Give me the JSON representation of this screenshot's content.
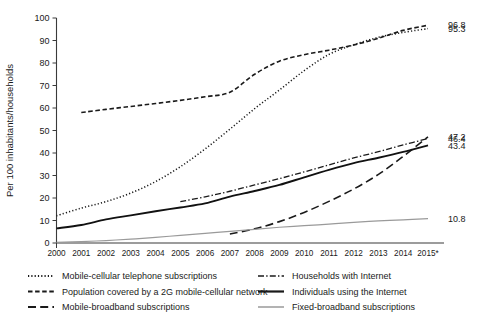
{
  "chart_data": {
    "type": "line",
    "title": "",
    "xlabel": "",
    "ylabel": "Per 100 inhabitants/households",
    "ylim": [
      0,
      100
    ],
    "ytick_step": 10,
    "yticks": [
      "0",
      "10",
      "20",
      "30",
      "40",
      "50",
      "60",
      "70",
      "80",
      "90",
      "100"
    ],
    "grid": false,
    "legend_position": "bottom",
    "x": [
      "2000",
      "2001",
      "2002",
      "2003",
      "2004",
      "2005",
      "2006",
      "2007",
      "2008",
      "2009",
      "2010",
      "2011",
      "2012",
      "2013",
      "2014",
      "2015*"
    ],
    "categories": [
      "2000",
      "2001",
      "2002",
      "2003",
      "2004",
      "2005",
      "2006",
      "2007",
      "2008",
      "2009",
      "2010",
      "2011",
      "2012",
      "2013",
      "2014",
      "2015*"
    ],
    "footnote_marker": "*",
    "series": [
      {
        "name": "Mobile-cellular telephone subscriptions",
        "style": "dotted",
        "color": "#1a1a1a",
        "end_label": "95.3",
        "values": [
          12.1,
          15.5,
          18.4,
          22.2,
          27.3,
          33.9,
          41.8,
          50.6,
          59.7,
          68.0,
          76.6,
          83.8,
          88.1,
          91.4,
          93.6,
          95.3
        ]
      },
      {
        "name": "Population covered by a 2G mobile-cellular network",
        "style": "dashed",
        "color": "#1a1a1a",
        "end_label": "96.8",
        "values": [
          null,
          58.0,
          59.4,
          60.7,
          62.0,
          63.4,
          65.0,
          67.0,
          75.0,
          80.8,
          83.7,
          85.7,
          88.0,
          91.0,
          94.5,
          96.8
        ]
      },
      {
        "name": "Mobile-broadband subscriptions",
        "style": "longdash",
        "color": "#1a1a1a",
        "end_label": "47.2",
        "values": [
          null,
          null,
          null,
          null,
          null,
          null,
          null,
          4.0,
          6.3,
          9.5,
          13.6,
          18.5,
          24.0,
          30.5,
          38.5,
          47.2
        ]
      },
      {
        "name": "Households with Internet",
        "style": "dashdot",
        "color": "#1a1a1a",
        "end_label": "46.4",
        "values": [
          null,
          null,
          null,
          null,
          null,
          18.4,
          20.5,
          23.0,
          25.8,
          28.6,
          31.6,
          34.7,
          37.8,
          40.6,
          43.6,
          46.4
        ]
      },
      {
        "name": "Individuals using the Internet",
        "style": "solid",
        "color": "#111111",
        "end_label": "43.4",
        "values": [
          6.5,
          8.0,
          10.5,
          12.3,
          14.1,
          15.8,
          17.6,
          20.6,
          23.1,
          25.8,
          29.2,
          32.5,
          35.5,
          37.9,
          40.5,
          43.4
        ]
      },
      {
        "name": "Fixed-broadband subscriptions",
        "style": "solid-gray",
        "color": "#9a9a9a",
        "end_label": "10.8",
        "values": [
          0.3,
          0.6,
          1.1,
          1.7,
          2.5,
          3.4,
          4.3,
          5.2,
          6.1,
          7.0,
          7.7,
          8.4,
          9.2,
          9.8,
          10.3,
          10.8
        ]
      }
    ]
  },
  "axis": {
    "ylabel": "Per 100 inhabitants/households"
  },
  "legend": {
    "left_column": [
      {
        "label": "Mobile-cellular telephone subscriptions",
        "marker": "dotted-line-marker"
      },
      {
        "label": "Population covered by a 2G mobile-cellular network",
        "marker": "dashed-line-marker"
      },
      {
        "label": "Mobile-broadband subscriptions",
        "marker": "longdash-line-marker"
      }
    ],
    "right_column": [
      {
        "label": "Households with Internet",
        "marker": "dashdot-line-marker"
      },
      {
        "label": "Individuals using the Internet",
        "marker": "solid-line-marker"
      },
      {
        "label": "Fixed-broadband subscriptions",
        "marker": "gray-line-marker"
      }
    ]
  },
  "end_labels": [
    "96.8",
    "95.3",
    "47.2",
    "46.4",
    "43.4",
    "10.8"
  ],
  "colors": {
    "axis": "#3a3a3a",
    "ink": "#1a1a1a",
    "gray_series": "#9a9a9a",
    "background": "#ffffff"
  }
}
